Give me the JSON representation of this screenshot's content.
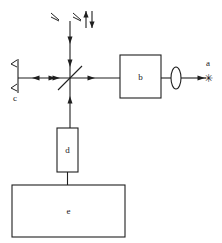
{
  "figure": {
    "type": "optical-schematic",
    "background_color": "#ffffff",
    "line_color": "#1f1f1f",
    "width": 222,
    "height": 243
  },
  "labels": {
    "a": "a",
    "b": "b",
    "c": "c",
    "d": "d",
    "e": "e"
  },
  "components": {
    "star_source": {
      "glyph": "✳",
      "label": "a",
      "x": 208,
      "y": 78
    },
    "box_b": {
      "label": "b",
      "x": 120,
      "y": 55,
      "width": 41,
      "height": 43
    },
    "box_d": {
      "label": "d",
      "x": 57,
      "y": 128,
      "width": 21,
      "height": 44
    },
    "box_e": {
      "label": "e",
      "x": 12,
      "y": 185,
      "width": 113,
      "height": 52
    },
    "lens": {
      "cx": 176,
      "cy": 78,
      "rx": 5,
      "ry": 11
    },
    "mirror_c": {
      "label": "c",
      "x": 18,
      "y_top": 60,
      "y_bottom": 92
    },
    "beamsplitter": {
      "cx": 70,
      "cy": 78,
      "half_length": 17
    }
  },
  "beam_paths": {
    "horizontal_y": 78,
    "vertical_x": 70,
    "top_beam_start_y": 22,
    "bottom_beam_end_y": 128
  }
}
